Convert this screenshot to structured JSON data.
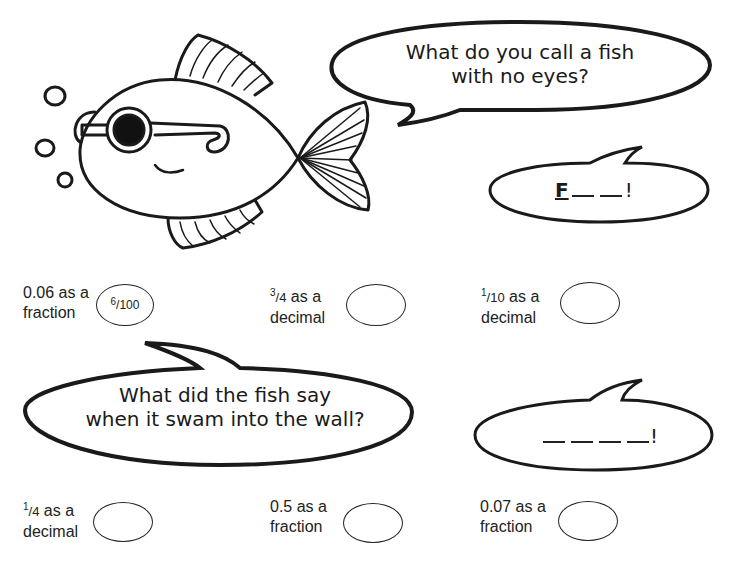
{
  "worksheet": {
    "bubbles": [
      {
        "id": "question-1",
        "text_line1": "What do you call a fish",
        "text_line2": "with no eyes?"
      },
      {
        "id": "answer-1",
        "first_letter": "F",
        "blank_count": 2,
        "end_mark": "!"
      },
      {
        "id": "question-2",
        "text_line1": "What did the fish say",
        "text_line2": "when it swam into the wall?"
      },
      {
        "id": "answer-2",
        "blank_count": 4,
        "end_mark": "!"
      }
    ],
    "problems_row1": [
      {
        "prompt_num": "0.06",
        "prompt_rest": " as a",
        "prompt_line2": "fraction",
        "answer_num": "6",
        "answer_den": "/100"
      },
      {
        "prompt_sup": "3",
        "prompt_den": "/4",
        "prompt_rest": " as a",
        "prompt_line2": "decimal",
        "answer": ""
      },
      {
        "prompt_sup": "1",
        "prompt_den": "/10",
        "prompt_rest": " as a",
        "prompt_line2": "decimal",
        "answer": ""
      }
    ],
    "problems_row2": [
      {
        "prompt_sup": "1",
        "prompt_den": "/4",
        "prompt_rest": " as a",
        "prompt_line2": "decimal",
        "answer": ""
      },
      {
        "prompt_num": "0.5",
        "prompt_rest": " as a",
        "prompt_line2": "fraction",
        "answer": ""
      },
      {
        "prompt_num": "0.07",
        "prompt_rest": " as a",
        "prompt_line2": "fraction",
        "answer": ""
      }
    ]
  }
}
